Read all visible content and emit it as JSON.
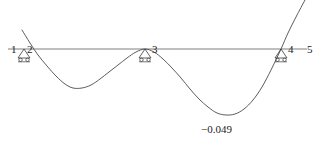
{
  "figure": {
    "type": "beam-deflection-diagram",
    "background_color": "#ffffff",
    "line_color": "#3a3a3a",
    "text_color": "#1a1a1a"
  },
  "chart_data": {
    "type": "line",
    "title": "",
    "xlabel": "",
    "ylabel": "",
    "grid": false,
    "legend": null,
    "baseline_y": 0,
    "annotations": [
      {
        "name": "min-deflection",
        "text": "−0.049",
        "value": -0.049,
        "x": 225,
        "y": 115
      }
    ],
    "supports": [
      {
        "name": "support-left",
        "nodes": [
          "1",
          "2"
        ],
        "x": 24,
        "y": 49,
        "kind": "roller"
      },
      {
        "name": "support-middle",
        "nodes": [
          "3"
        ],
        "x": 145,
        "y": 49,
        "kind": "roller"
      },
      {
        "name": "support-right",
        "nodes": [
          "4"
        ],
        "x": 281,
        "y": 49,
        "kind": "roller"
      }
    ],
    "node_labels": [
      {
        "name": "node-label-1",
        "text": "1",
        "x": 11,
        "y": 44
      },
      {
        "name": "node-label-2",
        "text": "2",
        "x": 27,
        "y": 44
      },
      {
        "name": "node-label-3",
        "text": "3",
        "x": 152,
        "y": 44
      },
      {
        "name": "node-label-4",
        "text": "4",
        "x": 288,
        "y": 44
      },
      {
        "name": "node-label-5",
        "text": "5",
        "x": 307,
        "y": 44
      }
    ],
    "axis_line": {
      "x1": 8,
      "y1": 49,
      "x2": 307,
      "y2": 49
    },
    "series": [
      {
        "name": "deflected-shape",
        "points": [
          [
            22,
            30
          ],
          [
            30,
            43
          ],
          [
            38,
            55
          ],
          [
            47,
            66
          ],
          [
            56,
            76
          ],
          [
            65,
            84
          ],
          [
            73,
            88
          ],
          [
            82,
            88
          ],
          [
            91,
            85
          ],
          [
            100,
            79
          ],
          [
            109,
            72
          ],
          [
            118,
            65
          ],
          [
            127,
            58
          ],
          [
            136,
            52
          ],
          [
            145,
            49
          ],
          [
            154,
            52
          ],
          [
            163,
            59
          ],
          [
            172,
            68
          ],
          [
            181,
            78
          ],
          [
            190,
            89
          ],
          [
            199,
            99
          ],
          [
            208,
            107
          ],
          [
            217,
            113
          ],
          [
            226,
            115
          ],
          [
            235,
            114
          ],
          [
            244,
            109
          ],
          [
            253,
            100
          ],
          [
            262,
            87
          ],
          [
            271,
            70
          ],
          [
            281,
            49
          ],
          [
            288,
            33
          ],
          [
            296,
            17
          ],
          [
            305,
            0
          ]
        ]
      }
    ]
  }
}
